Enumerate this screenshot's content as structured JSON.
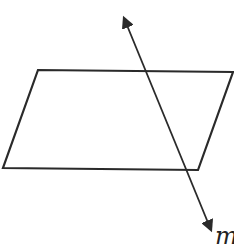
{
  "diagram": {
    "plane": {
      "shape": "parallelogram",
      "points": [
        [
          38,
          70
        ],
        [
          233,
          72
        ],
        [
          198,
          170
        ],
        [
          3,
          168
        ]
      ],
      "stroke": "#2a2a2a"
    },
    "line": {
      "label": "m",
      "start": [
        118,
        4
      ],
      "end": [
        218,
        244
      ],
      "arrows": "both",
      "stroke": "#2a2a2a"
    }
  }
}
